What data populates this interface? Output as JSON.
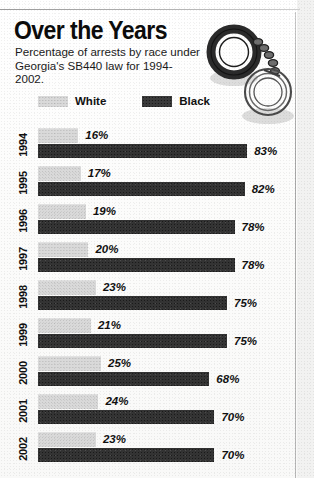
{
  "header": {
    "title": "Over the Years",
    "subtitle": "Percentage of arrests by race under Georgia's SB440 law for 1994-2002.",
    "illustration": "handcuffs-illustration"
  },
  "legend": {
    "white_label": "White",
    "black_label": "Black",
    "white_color": "#d9d9d9",
    "black_color": "#343434"
  },
  "chart_data": {
    "type": "bar",
    "title": "Over the Years",
    "subtitle": "Percentage of arrests by race under Georgia's SB440 law for 1994-2002.",
    "orientation": "horizontal",
    "xlabel": "",
    "ylabel": "",
    "xlim": [
      0,
      100
    ],
    "grid": false,
    "legend_position": "top",
    "categories": [
      "1994",
      "1995",
      "1996",
      "1997",
      "1998",
      "1999",
      "2000",
      "2001",
      "2002"
    ],
    "series": [
      {
        "name": "White",
        "color": "#d9d9d9",
        "values": [
          16,
          17,
          19,
          20,
          23,
          21,
          25,
          24,
          23
        ],
        "labels": [
          "16%",
          "17%",
          "19%",
          "20%",
          "23%",
          "21%",
          "25%",
          "24%",
          "23%"
        ]
      },
      {
        "name": "Black",
        "color": "#343434",
        "values": [
          83,
          82,
          78,
          78,
          75,
          75,
          68,
          70,
          70
        ],
        "labels": [
          "83%",
          "82%",
          "78%",
          "78%",
          "75%",
          "75%",
          "68%",
          "70%",
          "70%"
        ]
      }
    ]
  }
}
